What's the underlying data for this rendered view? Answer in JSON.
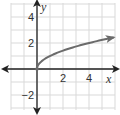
{
  "chart_data": {
    "type": "line",
    "title": "",
    "xlabel": "x",
    "ylabel": "y",
    "xlim": [
      -2,
      6
    ],
    "ylim": [
      -3,
      5
    ],
    "grid": true,
    "legend": null,
    "x_ticks": [
      {
        "value": 2,
        "label": "2"
      },
      {
        "value": 4,
        "label": "4"
      }
    ],
    "y_ticks": [
      {
        "value": 4,
        "label": "4"
      },
      {
        "value": 2,
        "label": "2"
      },
      {
        "value": -2,
        "label": "−2"
      }
    ],
    "series": [
      {
        "name": "y = √x",
        "function": "sqrt(x)",
        "x": [
          0,
          0.25,
          0.5,
          1,
          2,
          3,
          4,
          5,
          5.9
        ],
        "values": [
          0,
          0.5,
          0.71,
          1,
          1.41,
          1.73,
          2,
          2.24,
          2.43
        ],
        "start_point": {
          "x": 0,
          "y": 0,
          "closed": true
        },
        "end_arrow": true,
        "color": "#6b6b6b"
      }
    ],
    "colors": {
      "grid": "#d9d9d9",
      "axes": "#222222",
      "curve": "#6b6b6b"
    }
  }
}
